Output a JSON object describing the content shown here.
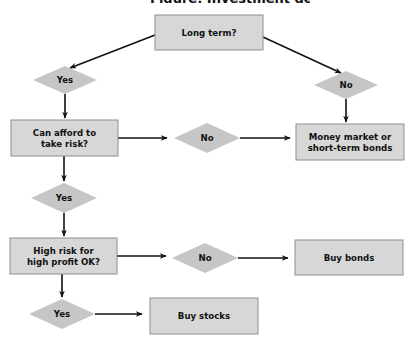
{
  "title": "Figure: Investment decision",
  "nodes": {
    "long_term": {
      "type": "process",
      "lines": [
        "Long term?"
      ]
    },
    "yes1": {
      "type": "decision",
      "lines": [
        "Yes"
      ]
    },
    "no1": {
      "type": "decision",
      "lines": [
        "No"
      ]
    },
    "afford_risk": {
      "type": "process",
      "lines": [
        "Can afford to",
        "take risk?"
      ]
    },
    "no2": {
      "type": "decision",
      "lines": [
        "No"
      ]
    },
    "money_market": {
      "type": "process",
      "lines": [
        "Money market or",
        "short-term bonds"
      ]
    },
    "yes2": {
      "type": "decision",
      "lines": [
        "Yes"
      ]
    },
    "high_risk": {
      "type": "process",
      "lines": [
        "High risk for",
        "high profit OK?"
      ]
    },
    "no3": {
      "type": "decision",
      "lines": [
        "No"
      ]
    },
    "buy_bonds": {
      "type": "process",
      "lines": [
        "Buy bonds"
      ]
    },
    "yes3": {
      "type": "decision",
      "lines": [
        "Yes"
      ]
    },
    "buy_stocks": {
      "type": "process",
      "lines": [
        "Buy stocks"
      ]
    }
  },
  "edges": [
    {
      "from": "long_term",
      "to": "yes1"
    },
    {
      "from": "long_term",
      "to": "no1"
    },
    {
      "from": "yes1",
      "to": "afford_risk"
    },
    {
      "from": "no1",
      "to": "money_market"
    },
    {
      "from": "afford_risk",
      "to": "no2"
    },
    {
      "from": "no2",
      "to": "money_market"
    },
    {
      "from": "afford_risk",
      "to": "yes2"
    },
    {
      "from": "yes2",
      "to": "high_risk"
    },
    {
      "from": "high_risk",
      "to": "no3"
    },
    {
      "from": "no3",
      "to": "buy_bonds"
    },
    {
      "from": "high_risk",
      "to": "yes3"
    },
    {
      "from": "yes3",
      "to": "buy_stocks"
    }
  ]
}
